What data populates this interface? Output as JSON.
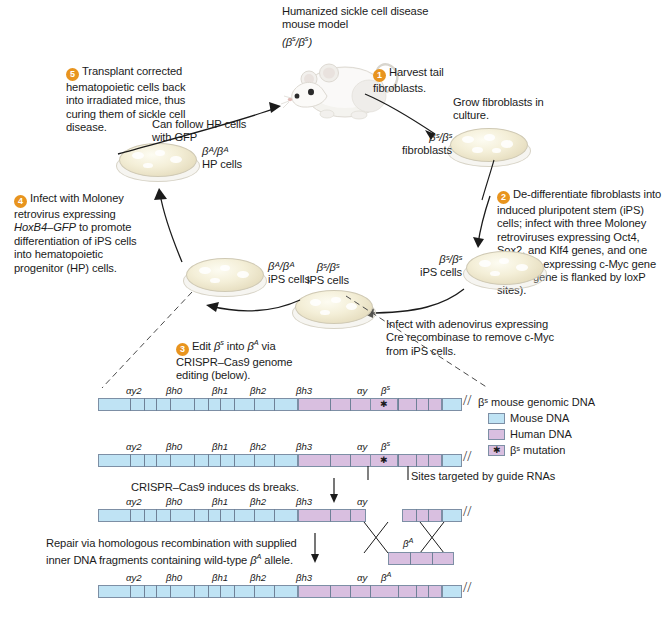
{
  "figure": {
    "title_top": "Humanized sickle cell disease mouse model",
    "title_genotype": "(βˢ/βˢ)"
  },
  "steps": [
    {
      "num": "1",
      "text": "Harvest tail fibroblasts."
    },
    {
      "num": "2",
      "text": "De-differentiate fibroblasts into induced pluripotent stem (iPS) cells; infect with three Moloney retroviruses expressing Oct4, Sox2, and Klf4 genes, and one lentivirus expressing c-Myc gene (c-Myc gene is flanked by loxP sites)."
    },
    {
      "num": "3",
      "text": "Edit βˢ into βᴬ via CRISPR–Cas9 genome editing (below)."
    },
    {
      "num": "4",
      "text": "Infect with Moloney retrovirus expressing HoxB4–GFP to promote differentiation of iPS cells into hematopoietic progenitor (HP) cells."
    },
    {
      "num": "5",
      "text": "Transplant  corrected hematopoietic cells back into irradiated mice, thus curing them of sickle cell disease."
    }
  ],
  "annotations": {
    "grow_fibroblasts": "Grow fibroblasts in culture.",
    "can_follow": "Can follow HP cells with GFP",
    "adenovirus": "Infect with adenovirus expressing Cre recombinase to remove c-Myc from iPS cells.",
    "ds_breaks": "CRISPR–Cas9 induces ds breaks.",
    "repair": "Repair via homologous recombination with supplied inner DNA fragments containing wild-type βᴬ allele.",
    "guide_rnas": "Sites targeted by guide RNAs",
    "genomic_dna": "βˢ mouse genomic DNA",
    "beta_a_fragment": "βᴬ"
  },
  "dishes": [
    {
      "id": "fibroblasts",
      "genotype": "βˢ/βˢ",
      "label": "fibroblasts"
    },
    {
      "id": "ips-s",
      "genotype": "βˢ/βˢ",
      "label": "iPS cells"
    },
    {
      "id": "ips-s-2",
      "genotype": "βˢ/βˢ",
      "label": "iPS cells"
    },
    {
      "id": "ips-a",
      "genotype": "βᴬ/βᴬ",
      "label": "iPS cells"
    },
    {
      "id": "hp-a",
      "genotype": "βᴬ/βᴬ",
      "label": "HP cells"
    }
  ],
  "legend": {
    "items": [
      {
        "label": "Mouse DNA",
        "color": "#bfe3f4",
        "marker": ""
      },
      {
        "label": "Human DNA",
        "color": "#d9bfe0",
        "marker": ""
      },
      {
        "label": "βˢ mutation",
        "color": "#d9bfe0",
        "marker": "✱"
      }
    ]
  },
  "gene_labels": {
    "a": "αy2",
    "b": "βh0",
    "c": "βh1",
    "d": "βh2",
    "e": "βh3",
    "f": "αy",
    "beta_s": "βˢ",
    "beta_a": "βᴬ"
  },
  "colors": {
    "step_badge": "#E8941E",
    "mouse_dna": "#bfe3f4",
    "human_dna": "#d9bfe0",
    "dna_outline": "#7d8fa5",
    "text": "#1b1b1b"
  }
}
